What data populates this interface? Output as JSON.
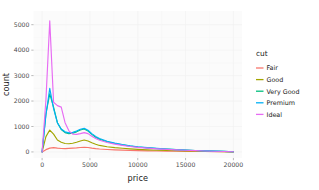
{
  "chart_data": {
    "type": "line",
    "title": "",
    "subtitle": "",
    "xlabel": "price",
    "ylabel": "count",
    "legend_title": "cut",
    "legend_position": "right",
    "grid": true,
    "xlim": [
      0,
      20000
    ],
    "ylim": [
      0,
      5300
    ],
    "xticks": [
      0,
      5000,
      10000,
      15000,
      20000
    ],
    "xtick_labels": [
      "0",
      "5000",
      "10000",
      "15000",
      "20000"
    ],
    "yticks": [
      0,
      1000,
      2000,
      3000,
      4000,
      5000
    ],
    "ytick_labels": [
      "0",
      "1000",
      "2000",
      "3000",
      "4000",
      "5000"
    ],
    "x": [
      0,
      400,
      800,
      1200,
      1600,
      2000,
      2400,
      2800,
      3200,
      3600,
      4000,
      4400,
      4800,
      5200,
      5600,
      6000,
      6800,
      7600,
      8400,
      9200,
      10000,
      11000,
      12000,
      13000,
      14000,
      15000,
      16000,
      17000,
      18000,
      19000,
      20000
    ],
    "series": [
      {
        "name": "Fair",
        "color": "#f8766d",
        "values": [
          0,
          90,
          150,
          170,
          150,
          135,
          130,
          140,
          150,
          160,
          175,
          185,
          175,
          150,
          130,
          115,
          95,
          80,
          70,
          60,
          52,
          44,
          38,
          32,
          27,
          23,
          19,
          15,
          12,
          9,
          4
        ]
      },
      {
        "name": "Good",
        "color": "#a3a500",
        "values": [
          0,
          600,
          860,
          700,
          470,
          380,
          330,
          320,
          340,
          380,
          430,
          470,
          430,
          360,
          300,
          255,
          205,
          170,
          145,
          120,
          100,
          82,
          68,
          56,
          46,
          37,
          29,
          22,
          16,
          11,
          4
        ]
      },
      {
        "name": "Very Good",
        "color": "#00bf7d",
        "values": [
          0,
          1500,
          2280,
          1760,
          1150,
          880,
          760,
          720,
          740,
          790,
          860,
          900,
          820,
          690,
          580,
          500,
          400,
          330,
          275,
          230,
          195,
          160,
          132,
          108,
          88,
          70,
          55,
          42,
          30,
          20,
          5
        ]
      },
      {
        "name": "Premium",
        "color": "#00b0f6"
      },
      {
        "name": "Ideal",
        "color": "#e76bf3",
        "values": [
          0,
          2050,
          5150,
          1950,
          1820,
          1760,
          1150,
          830,
          700,
          690,
          720,
          760,
          720,
          620,
          530,
          460,
          370,
          305,
          255,
          215,
          180,
          148,
          122,
          100,
          82,
          65,
          50,
          38,
          27,
          18,
          5
        ]
      }
    ],
    "premium_values": [
      0,
      1450,
      2500,
      1700,
      1140,
      900,
      790,
      750,
      770,
      820,
      890,
      930,
      850,
      720,
      610,
      525,
      420,
      348,
      290,
      242,
      205,
      168,
      139,
      114,
      93,
      74,
      58,
      44,
      32,
      21,
      5
    ]
  },
  "legend": {
    "title": "cut",
    "items": [
      {
        "label": "Fair",
        "color": "#f8766d"
      },
      {
        "label": "Good",
        "color": "#a3a500"
      },
      {
        "label": "Very Good",
        "color": "#00bf7d"
      },
      {
        "label": "Premium",
        "color": "#00b0f6"
      },
      {
        "label": "Ideal",
        "color": "#e76bf3"
      }
    ]
  },
  "axes": {
    "x_title": "price",
    "y_title": "count"
  }
}
